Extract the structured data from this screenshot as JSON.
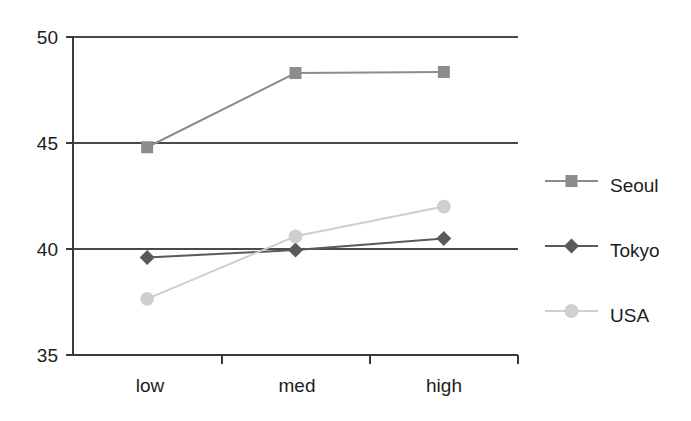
{
  "chart_data": {
    "type": "line",
    "title": "",
    "xlabel": "",
    "ylabel": "",
    "categories": [
      "low",
      "med",
      "high"
    ],
    "ylim": [
      35,
      50
    ],
    "yticks": [
      35,
      40,
      45,
      50
    ],
    "ytick_labels": [
      "35",
      "40",
      "45",
      "50"
    ],
    "grid": true,
    "legend_position": "right",
    "series": [
      {
        "name": "Seoul",
        "values": [
          44.8,
          48.3,
          48.35
        ],
        "color": "#8c8c8c",
        "marker": "square"
      },
      {
        "name": "Tokyo",
        "values": [
          39.6,
          39.95,
          40.5
        ],
        "color": "#5a5a5a",
        "marker": "diamond"
      },
      {
        "name": "USA",
        "values": [
          37.65,
          40.6,
          42.0
        ],
        "color": "#cfcfcf",
        "marker": "circle"
      }
    ]
  },
  "axes": {
    "y_labels": [
      "50",
      "45",
      "40",
      "35"
    ],
    "x_labels": [
      "low",
      "med",
      "high"
    ]
  },
  "legend": {
    "entries": [
      {
        "label": "Seoul"
      },
      {
        "label": "Tokyo"
      },
      {
        "label": "USA"
      }
    ]
  },
  "colors": {
    "axis": "#3a3a3a",
    "grid": "#4a4a4a",
    "text": "#1d1d1d",
    "background": "#ffffff",
    "seoul": "#8c8c8c",
    "tokyo": "#5a5a5a",
    "usa": "#cfcfcf"
  }
}
